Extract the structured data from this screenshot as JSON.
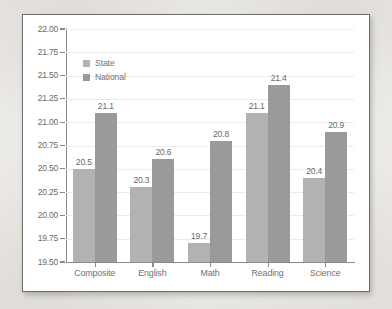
{
  "chart_data": {
    "type": "bar",
    "title": "",
    "xlabel": "",
    "ylabel": "",
    "ylim": [
      19.5,
      22.0
    ],
    "ytick_step": 0.25,
    "grid": true,
    "legend_position": "top-left-inside",
    "categories": [
      "Composite",
      "English",
      "Math",
      "Reading",
      "Science"
    ],
    "yticks": [
      "22.00",
      "21.75",
      "21.50",
      "21.25",
      "21.00",
      "20.75",
      "20.50",
      "20.25",
      "20.00",
      "19.75",
      "19.50"
    ],
    "series": [
      {
        "name": "State",
        "color": "#b2b2b2",
        "values": [
          20.5,
          20.3,
          19.7,
          21.1,
          20.4
        ],
        "labels": [
          "20.5",
          "20.3",
          "19.7",
          "21.1",
          "20.4"
        ]
      },
      {
        "name": "National",
        "color": "#9a9a9a",
        "values": [
          21.1,
          20.6,
          20.8,
          21.4,
          20.9
        ],
        "labels": [
          "21.1",
          "20.6",
          "20.8",
          "21.4",
          "20.9"
        ]
      }
    ]
  },
  "legend": {
    "items": [
      {
        "label": "State"
      },
      {
        "label": "National"
      }
    ]
  }
}
